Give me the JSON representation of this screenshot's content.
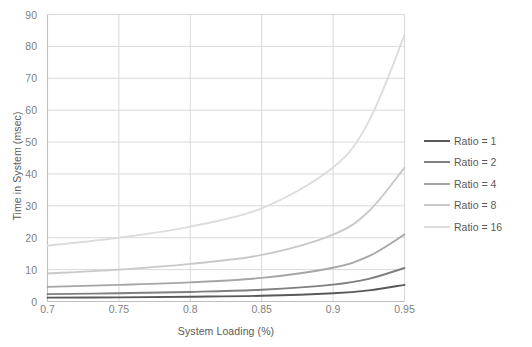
{
  "chart_data": {
    "type": "line",
    "title": "",
    "xlabel": "System Loading (%)",
    "ylabel": "Time in System (msec)",
    "xlim": [
      0.7,
      0.95
    ],
    "ylim": [
      0,
      90
    ],
    "xticks": [
      "0.7",
      "0.75",
      "0.8",
      "0.85",
      "0.9",
      "0.95"
    ],
    "xtick_values": [
      0.7,
      0.75,
      0.8,
      0.85,
      0.9,
      0.95
    ],
    "yticks": [
      "0",
      "10",
      "20",
      "30",
      "40",
      "50",
      "60",
      "70",
      "80",
      "90"
    ],
    "ytick_values": [
      0,
      10,
      20,
      30,
      40,
      50,
      60,
      70,
      80,
      90
    ],
    "grid": true,
    "legend_position": "right",
    "x": [
      0.7,
      0.75,
      0.8,
      0.85,
      0.9,
      0.925,
      0.95
    ],
    "series": [
      {
        "name": "Ratio = 1",
        "color": "#595959",
        "values": [
          1.2,
          1.3,
          1.5,
          1.8,
          2.6,
          3.5,
          5.2
        ]
      },
      {
        "name": "Ratio = 2",
        "color": "#7f7f7f",
        "values": [
          2.3,
          2.6,
          3.0,
          3.7,
          5.3,
          7.1,
          10.5
        ]
      },
      {
        "name": "Ratio = 4",
        "color": "#a6a6a6",
        "values": [
          4.6,
          5.2,
          6.0,
          7.4,
          10.6,
          14.2,
          21.0
        ]
      },
      {
        "name": "Ratio = 8",
        "color": "#c9c9c9",
        "values": [
          8.8,
          10.0,
          11.8,
          14.6,
          21.0,
          28.3,
          42.0
        ]
      },
      {
        "name": "Ratio = 16",
        "color": "#dcdcdc",
        "values": [
          17.5,
          20.0,
          23.5,
          29.2,
          42.0,
          56.5,
          83.5
        ]
      }
    ]
  },
  "legend": {
    "entries": [
      {
        "label": "Ratio = 1"
      },
      {
        "label": "Ratio = 2"
      },
      {
        "label": "Ratio = 4"
      },
      {
        "label": "Ratio = 8"
      },
      {
        "label": "Ratio = 16"
      }
    ]
  },
  "style": {
    "grid_color": "#d9d9d9",
    "axis_color": "#bfbfbf",
    "tick_text_color": "#7f7f7f",
    "title_text_color": "#5a5a5a",
    "background": "#ffffff"
  }
}
